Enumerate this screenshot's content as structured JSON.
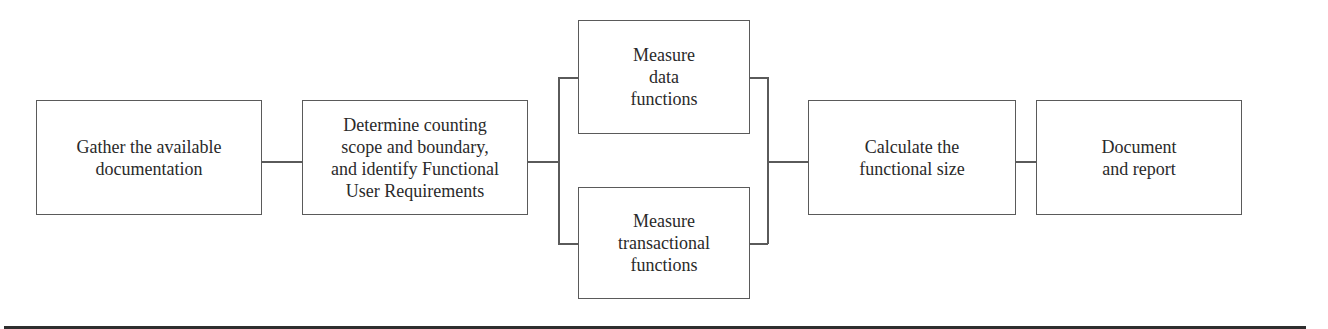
{
  "diagram": {
    "type": "process-flow",
    "steps": [
      {
        "id": "gather",
        "label": "Gather the available\ndocumentation"
      },
      {
        "id": "determine",
        "label": "Determine counting\nscope and boundary,\nand identify Functional\nUser Requirements"
      },
      {
        "id": "measure_data",
        "label": "Measure\ndata\nfunctions"
      },
      {
        "id": "measure_trans",
        "label": "Measure\ntransactional\nfunctions"
      },
      {
        "id": "calculate",
        "label": "Calculate the\nfunctional size"
      },
      {
        "id": "document",
        "label": "Document\nand report"
      }
    ],
    "connections": [
      {
        "from": "gather",
        "to": "determine"
      },
      {
        "from": "determine",
        "to": "measure_data"
      },
      {
        "from": "determine",
        "to": "measure_trans"
      },
      {
        "from": "measure_data",
        "to": "calculate"
      },
      {
        "from": "measure_trans",
        "to": "calculate"
      },
      {
        "from": "calculate",
        "to": "document"
      }
    ],
    "colors": {
      "line": "#5a5a5a",
      "text": "#2a2a2a",
      "background": "#ffffff"
    }
  }
}
